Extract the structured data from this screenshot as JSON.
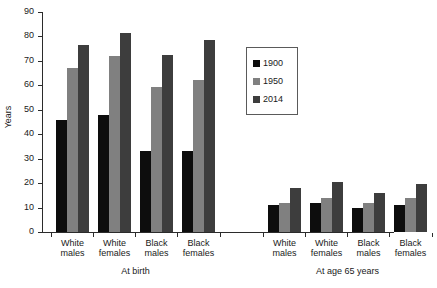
{
  "chart_data": {
    "type": "bar",
    "title": "",
    "xlabel": "",
    "ylabel": "Years",
    "ylim": [
      0,
      90
    ],
    "ytick_step": 10,
    "yticks": [
      "0",
      "10",
      "20",
      "30",
      "40",
      "50",
      "60",
      "70",
      "80",
      "90"
    ],
    "grid": false,
    "legend_position": "upper-center-right",
    "categories": [
      "White males",
      "White females",
      "Black males",
      "Black females",
      "White males",
      "White females",
      "Black males",
      "Black females"
    ],
    "groups": [
      {
        "label": "At birth",
        "categories": [
          "White males",
          "White females",
          "Black males",
          "Black females"
        ]
      },
      {
        "label": "At age 65 years",
        "categories": [
          "White males",
          "White females",
          "Black males",
          "Black females"
        ]
      }
    ],
    "series": [
      {
        "name": "1900",
        "color": "#0d0d0d",
        "values": [
          46,
          48,
          33,
          33,
          11,
          12,
          10,
          11
        ]
      },
      {
        "name": "1950",
        "color": "#808080",
        "values": [
          67,
          72,
          59.5,
          62,
          12,
          14,
          12,
          14
        ]
      },
      {
        "name": "2014",
        "color": "#3d3d3d",
        "values": [
          76.5,
          81.5,
          72.5,
          78.5,
          18,
          20.5,
          16,
          19.5
        ]
      }
    ]
  },
  "legend": {
    "entries": [
      {
        "label": "1900",
        "color": "#0d0d0d"
      },
      {
        "label": "1950",
        "color": "#808080"
      },
      {
        "label": "2014",
        "color": "#3d3d3d"
      }
    ]
  },
  "axis": {
    "y_title": "Years"
  }
}
